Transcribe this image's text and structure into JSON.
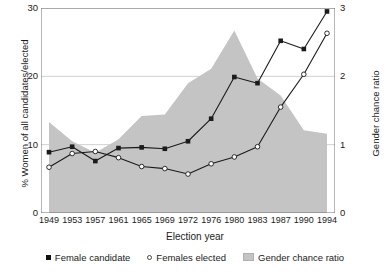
{
  "chart_data": {
    "type": "line",
    "title": "",
    "xlabel": "Election year",
    "ylabel": "% Women of all candidates/elected",
    "y2label": "Gender chance ratio",
    "categories": [
      "1949",
      "1953",
      "1957",
      "1961",
      "1965",
      "1969",
      "1972",
      "1976",
      "1980",
      "1983",
      "1987",
      "1990",
      "1994"
    ],
    "ylim": [
      0,
      30
    ],
    "y2lim": [
      0,
      3
    ],
    "yticks": [
      "0",
      "10",
      "20",
      "30"
    ],
    "ytick_values": [
      0,
      10,
      20,
      30
    ],
    "y2ticks": [
      "0",
      "1",
      "2",
      "3"
    ],
    "y2tick_values": [
      0,
      1,
      2,
      3
    ],
    "grid": true,
    "legend_position": "bottom",
    "series": [
      {
        "name": "Female candidate",
        "marker": "filled-square",
        "axis": "left",
        "values": [
          8.9,
          9.7,
          7.6,
          9.5,
          9.6,
          9.4,
          10.5,
          13.8,
          19.9,
          19.0,
          25.2,
          24.0,
          29.5
        ]
      },
      {
        "name": "Females elected",
        "marker": "open-circle",
        "axis": "left",
        "values": [
          6.7,
          8.7,
          9.0,
          8.1,
          6.8,
          6.5,
          5.7,
          7.2,
          8.2,
          9.7,
          15.5,
          20.3,
          26.3
        ]
      },
      {
        "name": "Gender chance ratio",
        "marker": "area",
        "axis": "right",
        "values": [
          1.33,
          1.05,
          0.88,
          1.08,
          1.42,
          1.44,
          1.9,
          2.11,
          2.67,
          1.97,
          1.72,
          1.21,
          1.16
        ]
      }
    ]
  },
  "legend": {
    "items": [
      {
        "label": "Female candidate",
        "marker": "filled-square"
      },
      {
        "label": "Females elected",
        "marker": "open-circle"
      },
      {
        "label": "Gender chance ratio",
        "marker": "gray-swatch"
      }
    ]
  },
  "colors": {
    "line": "#1b1b1b",
    "area_fill": "#c4c4c4",
    "grid": "#d0d0d0",
    "axis": "#6f6f6f",
    "text": "#1b1b1b"
  },
  "caption": {
    "fragment": ""
  }
}
